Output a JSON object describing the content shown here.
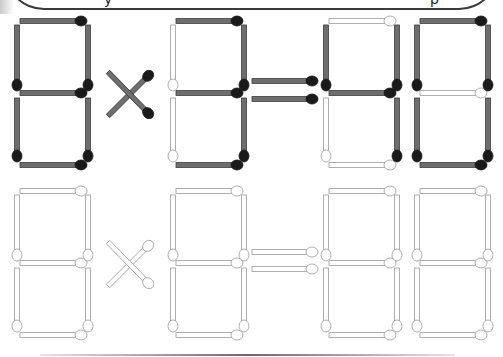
{
  "puzzle": {
    "title_bubble_glyphs": [
      "y",
      "p"
    ],
    "equation_shown": "8×3=40",
    "operator": "×",
    "equals": "=",
    "digits_top": [
      {
        "value": "8",
        "segments": {
          "a": 1,
          "b": 1,
          "c": 1,
          "d": 1,
          "e": 1,
          "f": 1,
          "g": 1
        }
      },
      {
        "value": "3",
        "segments": {
          "a": 1,
          "b": 1,
          "c": 1,
          "d": 1,
          "e": 0,
          "f": 0,
          "g": 1
        }
      },
      {
        "value": "4",
        "segments": {
          "a": 0,
          "b": 1,
          "c": 1,
          "d": 0,
          "e": 0,
          "f": 1,
          "g": 1
        }
      },
      {
        "value": "0",
        "segments": {
          "a": 1,
          "b": 1,
          "c": 1,
          "d": 1,
          "e": 1,
          "f": 1,
          "g": 0
        }
      }
    ],
    "answer_row": "empty-template",
    "colors": {
      "match_stick": "#6e6e6e",
      "match_stick_edge": "#3a3a3a",
      "match_head": "#1a1a1a",
      "empty_stick": "#ffffff",
      "empty_edge": "#9a9a9a"
    }
  }
}
